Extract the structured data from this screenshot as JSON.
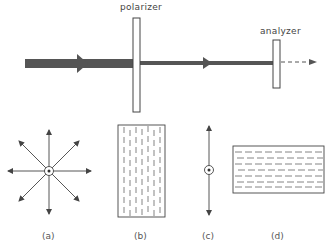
{
  "labels": {
    "polarizer": "polarizer",
    "analyzer": "analyzer"
  },
  "captions": {
    "a": "(a)",
    "b": "(b)",
    "c": "(c)",
    "d": "(d)"
  },
  "colors": {
    "beam": "#555555",
    "line": "#444444"
  }
}
